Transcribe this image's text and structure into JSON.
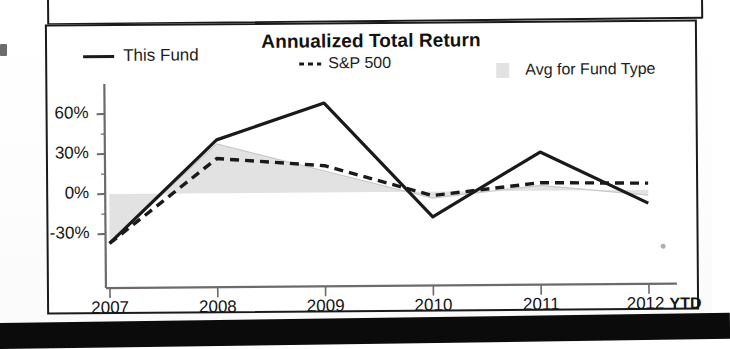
{
  "chart_data": {
    "type": "line",
    "title": "Annualized Total Return",
    "xlabel": "",
    "ylabel": "",
    "categories": [
      "2007",
      "2008",
      "2009",
      "2010",
      "2011",
      "2012"
    ],
    "x_tick_suffix_label": "YTD",
    "y_ticks": [
      60,
      30,
      0,
      -30
    ],
    "y_tick_labels": [
      "60%",
      "30%",
      "0%",
      "-30%"
    ],
    "ylim": [
      -45,
      75
    ],
    "grid": false,
    "legend_position": "top",
    "series": [
      {
        "name": "This Fund",
        "style": "solid",
        "color": "#1a1a1a",
        "values": [
          -37,
          40,
          67,
          -19,
          29,
          -10
        ]
      },
      {
        "name": "S&P 500",
        "style": "dashed",
        "color": "#1a1a1a",
        "values": [
          -37,
          26,
          20,
          -3,
          6,
          5
        ]
      },
      {
        "name": "Avg for Fund Type",
        "style": "filled-area",
        "color": "#e2e2e2",
        "values": [
          -37,
          37,
          16,
          -5,
          4,
          -4
        ]
      }
    ]
  },
  "chart": {
    "title": "Annualized Total Return",
    "legend": {
      "this_fund": "This Fund",
      "sp500": "S&P 500",
      "avg_fund_type": "Avg for Fund Type"
    },
    "y_axis": {
      "labels": [
        "60%",
        "30%",
        "0%",
        "-30%"
      ]
    },
    "x_axis": {
      "labels": [
        "2007",
        "2008",
        "2009",
        "2010",
        "2011",
        "2012"
      ],
      "ytd_label": "YTD"
    }
  },
  "colors": {
    "line": "#1a1a1a",
    "area": "#e2e2e2",
    "axis": "#6b6b6b",
    "border": "#1a1a1a",
    "background": "#ffffff"
  }
}
